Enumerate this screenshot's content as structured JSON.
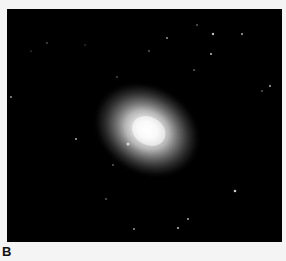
{
  "figure": {
    "panel_label": "B",
    "image": {
      "subject": "elliptical-galaxy-telescope-image",
      "background_color": "#000000",
      "galaxy": {
        "cx": 140,
        "cy": 121,
        "rx": 50,
        "ry": 40,
        "rotation_deg": 30
      },
      "stars": [
        {
          "x": 190,
          "y": 16,
          "r": 0.8
        },
        {
          "x": 206,
          "y": 25,
          "r": 1.2
        },
        {
          "x": 235,
          "y": 25,
          "r": 1.0
        },
        {
          "x": 160,
          "y": 29,
          "r": 0.9
        },
        {
          "x": 142,
          "y": 42,
          "r": 0.8
        },
        {
          "x": 204,
          "y": 45,
          "r": 1.1
        },
        {
          "x": 187,
          "y": 61,
          "r": 0.8
        },
        {
          "x": 263,
          "y": 77,
          "r": 1.0
        },
        {
          "x": 255,
          "y": 82,
          "r": 0.8
        },
        {
          "x": 4,
          "y": 88,
          "r": 0.9
        },
        {
          "x": 69,
          "y": 130,
          "r": 1.0
        },
        {
          "x": 121,
          "y": 135,
          "r": 1.5
        },
        {
          "x": 106,
          "y": 156,
          "r": 0.8
        },
        {
          "x": 99,
          "y": 190,
          "r": 0.8
        },
        {
          "x": 127,
          "y": 220,
          "r": 0.9
        },
        {
          "x": 228,
          "y": 182,
          "r": 1.3
        },
        {
          "x": 181,
          "y": 210,
          "r": 1.0
        },
        {
          "x": 171,
          "y": 219,
          "r": 1.1
        },
        {
          "x": 40,
          "y": 34,
          "r": 0.7
        },
        {
          "x": 24,
          "y": 42,
          "r": 0.6
        },
        {
          "x": 78,
          "y": 36,
          "r": 0.6
        },
        {
          "x": 110,
          "y": 68,
          "r": 0.7
        }
      ]
    }
  }
}
